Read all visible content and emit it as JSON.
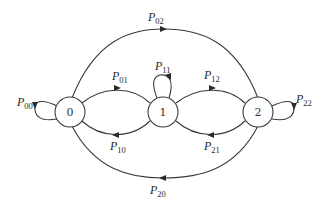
{
  "diagram": {
    "type": "markov-chain-state-transition",
    "nodes": [
      {
        "id": "0",
        "label": "0"
      },
      {
        "id": "1",
        "label": "1"
      },
      {
        "id": "2",
        "label": "2"
      }
    ],
    "edges": [
      {
        "from": "0",
        "to": "0",
        "label_main": "P",
        "label_sub": "00"
      },
      {
        "from": "0",
        "to": "1",
        "label_main": "P",
        "label_sub": "01"
      },
      {
        "from": "0",
        "to": "2",
        "label_main": "P",
        "label_sub": "02"
      },
      {
        "from": "1",
        "to": "0",
        "label_main": "P",
        "label_sub": "10"
      },
      {
        "from": "1",
        "to": "1",
        "label_main": "P",
        "label_sub": "11"
      },
      {
        "from": "1",
        "to": "2",
        "label_main": "P",
        "label_sub": "12"
      },
      {
        "from": "2",
        "to": "0",
        "label_main": "P",
        "label_sub": "20"
      },
      {
        "from": "2",
        "to": "1",
        "label_main": "P",
        "label_sub": "21"
      },
      {
        "from": "2",
        "to": "2",
        "label_main": "P",
        "label_sub": "22"
      }
    ]
  }
}
